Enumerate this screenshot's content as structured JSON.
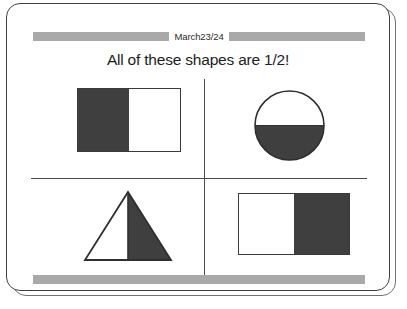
{
  "slide": {
    "header_date": "March23/24",
    "title": "All of these shapes are 1/2!",
    "colors": {
      "fill": "#3f3f3f",
      "outline": "#3a3a3a",
      "rule_gray": "#a9a9a9",
      "frame_border": "#3e4145",
      "background": "#ffffff",
      "text": "#1d1d1d"
    },
    "shapes": [
      {
        "name": "rectangle-left-half-shaded",
        "type": "rectangle",
        "shaded_portion": "left half",
        "fraction": "1/2",
        "quadrant": "top-left"
      },
      {
        "name": "circle-bottom-half-shaded",
        "type": "circle",
        "shaded_portion": "bottom half",
        "fraction": "1/2",
        "quadrant": "top-right"
      },
      {
        "name": "triangle-right-half-shaded",
        "type": "triangle",
        "shaded_portion": "right half",
        "fraction": "1/2",
        "quadrant": "bottom-left"
      },
      {
        "name": "rectangle-right-half-shaded",
        "type": "rectangle",
        "shaded_portion": "right half",
        "fraction": "1/2",
        "quadrant": "bottom-right"
      }
    ]
  }
}
